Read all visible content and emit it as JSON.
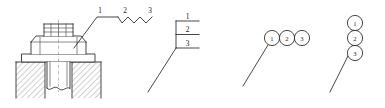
{
  "figure": {
    "stroke_color": "#262626",
    "background_color": "#ffffff",
    "width": 385,
    "height": 108
  },
  "panels": [
    {
      "id": "panel-bolt-assembly",
      "name": "bolted-joint-section-view",
      "description": "Sectioned bolted joint with hex nut, washer and hatched base, with a multi-segment leader carrying three item numbers",
      "callout_style": "zigzag-leader",
      "labels": [
        "1",
        "2",
        "3"
      ]
    },
    {
      "id": "panel-stacked-lines",
      "name": "stacked-shelf-callout",
      "description": "Vertical spine with three horizontal shelves, item numbers written above each shelf, single diagonal leader",
      "callout_style": "stacked-shelves",
      "labels": [
        "1",
        "2",
        "3"
      ]
    },
    {
      "id": "panel-horizontal-balloons",
      "name": "horizontal-balloon-chain",
      "description": "Three touching circular balloons in a horizontal row with a diagonal leader from the first balloon",
      "callout_style": "horizontal-balloons",
      "labels": [
        "1",
        "2",
        "3"
      ]
    },
    {
      "id": "panel-vertical-balloons",
      "name": "vertical-balloon-stack",
      "description": "Three touching circular balloons stacked vertically with a diagonal leader from the bottom balloon",
      "callout_style": "vertical-balloons",
      "labels": [
        "1",
        "2",
        "3"
      ]
    }
  ],
  "labels": {
    "one": "1",
    "two": "2",
    "three": "3"
  }
}
